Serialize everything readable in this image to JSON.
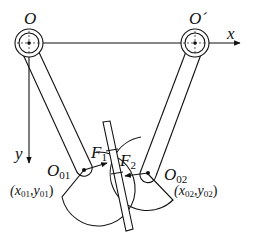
{
  "labels": {
    "origin": "O",
    "origin_prime": "O´",
    "x_axis": "x",
    "y_axis": "y",
    "pivot1_main": "O",
    "pivot1_sub": "01",
    "pivot2_main": "O",
    "pivot2_sub": "02",
    "force1_main": "F",
    "force1_sub": "1",
    "force2_main": "F",
    "force2_sub": "2",
    "coord1_open": "(x",
    "coord1_sub1": "01",
    "coord1_mid": ",y",
    "coord1_sub2": "01",
    "coord1_close": ")",
    "coord2_open": "(x",
    "coord2_sub1": "02",
    "coord2_mid": ",y",
    "coord2_sub2": "02",
    "coord2_close": ")"
  },
  "colors": {
    "stroke": "#111111",
    "background": "#ffffff"
  }
}
